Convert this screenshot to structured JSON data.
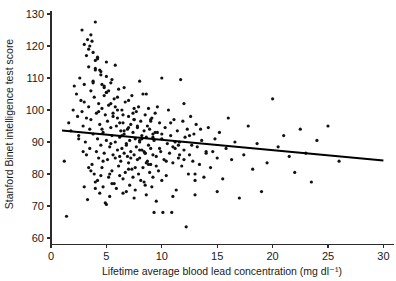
{
  "chart_data": {
    "type": "scatter",
    "title": "",
    "xlabel": "Lifetime average blood lead concentration (mg dl⁻¹)",
    "ylabel": "Stanford Binet intelligence test score",
    "xlim": [
      0,
      31
    ],
    "ylim": [
      58,
      131
    ],
    "xticks": [
      0,
      5,
      10,
      15,
      20,
      25,
      30
    ],
    "xtick_labels": [
      "0",
      "5",
      "10",
      "15",
      "20",
      "25",
      "30"
    ],
    "yticks": [
      60,
      70,
      80,
      90,
      100,
      110,
      120,
      130
    ],
    "ytick_labels": [
      "60",
      "70",
      "80",
      "90",
      "100",
      "110",
      "120",
      "130"
    ],
    "grid": false,
    "legend": null,
    "marker": "filled-circle",
    "marker_color": "#111111",
    "marker_size_px": 3.2,
    "trendline": {
      "name": "linear regression fit",
      "color": "#000000",
      "width_px": 2.1,
      "x_start": 1.0,
      "y_start": 93.6,
      "x_end": 30.0,
      "y_end": 84.2
    },
    "x": [
      1.2,
      1.4,
      1.6,
      1.8,
      2.0,
      2.1,
      2.3,
      2.4,
      2.5,
      2.6,
      2.7,
      2.8,
      2.9,
      3.0,
      3.0,
      3.1,
      3.2,
      3.2,
      3.3,
      3.4,
      3.4,
      3.5,
      3.5,
      3.6,
      3.6,
      3.7,
      3.7,
      3.8,
      3.8,
      3.9,
      3.9,
      4.0,
      4.0,
      4.1,
      4.1,
      4.2,
      4.2,
      4.3,
      4.3,
      4.4,
      4.4,
      4.5,
      4.5,
      4.6,
      4.6,
      4.7,
      4.7,
      4.8,
      4.8,
      4.9,
      4.9,
      5.0,
      5.0,
      5.1,
      5.1,
      5.2,
      5.2,
      5.3,
      5.3,
      5.4,
      5.4,
      5.5,
      5.5,
      5.6,
      5.6,
      5.7,
      5.7,
      5.8,
      5.8,
      5.9,
      5.9,
      6.0,
      6.0,
      6.1,
      6.1,
      6.2,
      6.2,
      6.3,
      6.3,
      6.4,
      6.4,
      6.5,
      6.5,
      6.6,
      6.6,
      6.7,
      6.7,
      6.8,
      6.8,
      6.9,
      6.9,
      7.0,
      7.0,
      7.1,
      7.1,
      7.2,
      7.2,
      7.3,
      7.3,
      7.4,
      7.4,
      7.5,
      7.5,
      7.6,
      7.6,
      7.7,
      7.7,
      7.8,
      7.8,
      7.9,
      7.9,
      8.0,
      8.0,
      8.1,
      8.1,
      8.2,
      8.2,
      8.3,
      8.3,
      8.4,
      8.4,
      8.5,
      8.5,
      8.6,
      8.6,
      8.7,
      8.7,
      8.8,
      8.8,
      8.9,
      8.9,
      9.0,
      9.0,
      9.1,
      9.1,
      9.2,
      9.2,
      9.3,
      9.3,
      9.4,
      9.5,
      9.6,
      9.7,
      9.8,
      9.9,
      10.0,
      10.1,
      10.2,
      10.3,
      10.4,
      10.5,
      10.6,
      10.7,
      10.8,
      10.9,
      11.0,
      11.1,
      11.2,
      11.3,
      11.4,
      11.5,
      11.6,
      11.7,
      11.8,
      11.9,
      12.0,
      12.1,
      12.2,
      12.3,
      12.4,
      12.5,
      12.6,
      12.7,
      12.8,
      12.9,
      13.0,
      13.1,
      13.2,
      13.4,
      13.6,
      13.8,
      14.0,
      14.2,
      14.4,
      14.6,
      14.8,
      15.0,
      15.2,
      15.5,
      15.8,
      16.0,
      16.3,
      16.6,
      17.0,
      17.4,
      17.8,
      18.2,
      18.6,
      19.0,
      19.5,
      20.0,
      20.5,
      21.0,
      21.5,
      22.0,
      22.5,
      23.0,
      23.5,
      24.0,
      25.0,
      26.0,
      4.2,
      4.4,
      4.6,
      4.8,
      5.0,
      5.2,
      5.4,
      5.6,
      5.8,
      6.0,
      6.2,
      6.4,
      6.6,
      6.8,
      7.0,
      7.2,
      7.4,
      7.6,
      7.8,
      8.0,
      8.2,
      8.4,
      8.6,
      8.8,
      9.0,
      9.2,
      9.4,
      9.6,
      9.8,
      10.0,
      10.4,
      10.8,
      11.2,
      11.6,
      12.0,
      12.5,
      13.0,
      13.5,
      14.0,
      3.4,
      3.6,
      3.8,
      4.0,
      4.2,
      4.5,
      4.8,
      5.0,
      5.5,
      6.0,
      6.5,
      7.0,
      7.5,
      8.0,
      8.5,
      9.0,
      9.5,
      10.0,
      11.0,
      12.0,
      2.8,
      3.0,
      3.2,
      3.5,
      3.8,
      4.0,
      4.3,
      4.6,
      5.0,
      5.4,
      5.8,
      6.2,
      6.6,
      7.0,
      7.5,
      8.0,
      8.6,
      9.2,
      10.0,
      11.5,
      3.0,
      3.3,
      3.6,
      4.0,
      4.5,
      5.0,
      5.5,
      6.5,
      7.5,
      8.5,
      9.5,
      11.0,
      13.0,
      15.0,
      2.5,
      2.9,
      3.4,
      4.0,
      4.7,
      5.3
    ],
    "y": [
      84.0,
      66.8,
      96.0,
      93.5,
      100.0,
      107.5,
      105.0,
      98.0,
      92.0,
      110.0,
      103.0,
      99.5,
      95.0,
      120.5,
      108.0,
      90.0,
      86.0,
      117.0,
      122.0,
      113.5,
      101.0,
      94.0,
      88.0,
      106.0,
      97.0,
      83.0,
      121.5,
      109.0,
      92.5,
      80.0,
      104.0,
      127.5,
      115.5,
      99.0,
      87.0,
      91.0,
      78.0,
      102.0,
      85.0,
      95.5,
      74.0,
      112.0,
      89.0,
      100.5,
      82.0,
      93.0,
      76.0,
      107.0,
      86.5,
      98.5,
      71.0,
      90.5,
      105.5,
      84.5,
      96.5,
      79.0,
      101.5,
      88.5,
      73.0,
      94.5,
      108.5,
      92.0,
      81.0,
      86.0,
      99.0,
      77.0,
      103.5,
      90.0,
      85.0,
      95.0,
      75.5,
      97.5,
      87.5,
      82.5,
      106.5,
      91.5,
      79.5,
      93.5,
      84.0,
      100.0,
      88.0,
      78.5,
      96.0,
      86.5,
      92.5,
      80.5,
      102.5,
      89.5,
      74.5,
      94.0,
      85.5,
      98.0,
      83.5,
      90.5,
      76.5,
      95.5,
      87.0,
      81.5,
      104.5,
      93.0,
      79.0,
      97.0,
      86.0,
      91.0,
      75.0,
      99.5,
      88.5,
      84.5,
      94.5,
      80.0,
      101.0,
      90.0,
      85.0,
      96.5,
      78.0,
      92.0,
      87.5,
      82.0,
      105.0,
      93.5,
      77.5,
      98.5,
      86.5,
      91.5,
      73.5,
      95.0,
      84.0,
      89.0,
      100.5,
      80.5,
      94.0,
      88.0,
      83.0,
      97.5,
      76.0,
      92.5,
      86.0,
      90.5,
      68.0,
      99.0,
      85.5,
      93.0,
      81.0,
      96.0,
      87.0,
      91.0,
      68.0,
      84.5,
      94.5,
      79.5,
      89.5,
      100.0,
      86.5,
      92.0,
      68.0,
      83.5,
      97.0,
      88.0,
      75.0,
      93.5,
      85.0,
      90.0,
      109.5,
      82.5,
      96.5,
      87.5,
      91.5,
      63.5,
      94.0,
      80.0,
      86.0,
      98.0,
      89.0,
      84.0,
      92.5,
      73.5,
      95.5,
      88.5,
      83.0,
      90.5,
      79.0,
      86.5,
      94.5,
      82.0,
      87.0,
      91.0,
      85.0,
      93.0,
      78.5,
      88.0,
      97.5,
      84.5,
      90.0,
      72.5,
      86.0,
      95.0,
      81.5,
      89.5,
      74.5,
      83.5,
      103.5,
      88.5,
      92.0,
      85.5,
      80.5,
      94.0,
      86.5,
      77.5,
      90.5,
      95.0,
      84.0,
      116.0,
      112.5,
      108.0,
      104.5,
      110.5,
      106.0,
      102.0,
      98.0,
      114.0,
      100.0,
      96.0,
      92.0,
      107.0,
      89.0,
      103.0,
      85.0,
      99.0,
      82.0,
      95.0,
      109.0,
      91.0,
      87.0,
      105.0,
      83.0,
      97.0,
      79.0,
      93.0,
      101.0,
      88.0,
      110.0,
      84.0,
      96.0,
      90.0,
      86.0,
      102.0,
      92.0,
      80.0,
      94.0,
      87.0,
      119.0,
      123.5,
      118.0,
      113.0,
      116.5,
      111.0,
      107.5,
      115.0,
      109.5,
      104.0,
      98.5,
      94.5,
      100.5,
      90.5,
      86.5,
      96.5,
      82.5,
      92.5,
      88.5,
      84.5,
      125.0,
      102.5,
      97.5,
      120.0,
      108.5,
      112.5,
      99.5,
      94.0,
      105.5,
      89.5,
      101.0,
      85.5,
      93.5,
      81.5,
      97.0,
      87.5,
      83.5,
      91.5,
      78.0,
      89.0,
      76.0,
      72.0,
      81.0,
      75.5,
      79.5,
      70.5,
      77.0,
      74.0,
      72.5,
      76.5,
      71.5,
      73.0,
      78.0,
      74.5,
      91.0,
      87.0,
      82.0,
      77.5,
      84.0,
      80.0
    ]
  },
  "figure": {
    "width": 396,
    "height": 281,
    "background": "#ffffff"
  }
}
